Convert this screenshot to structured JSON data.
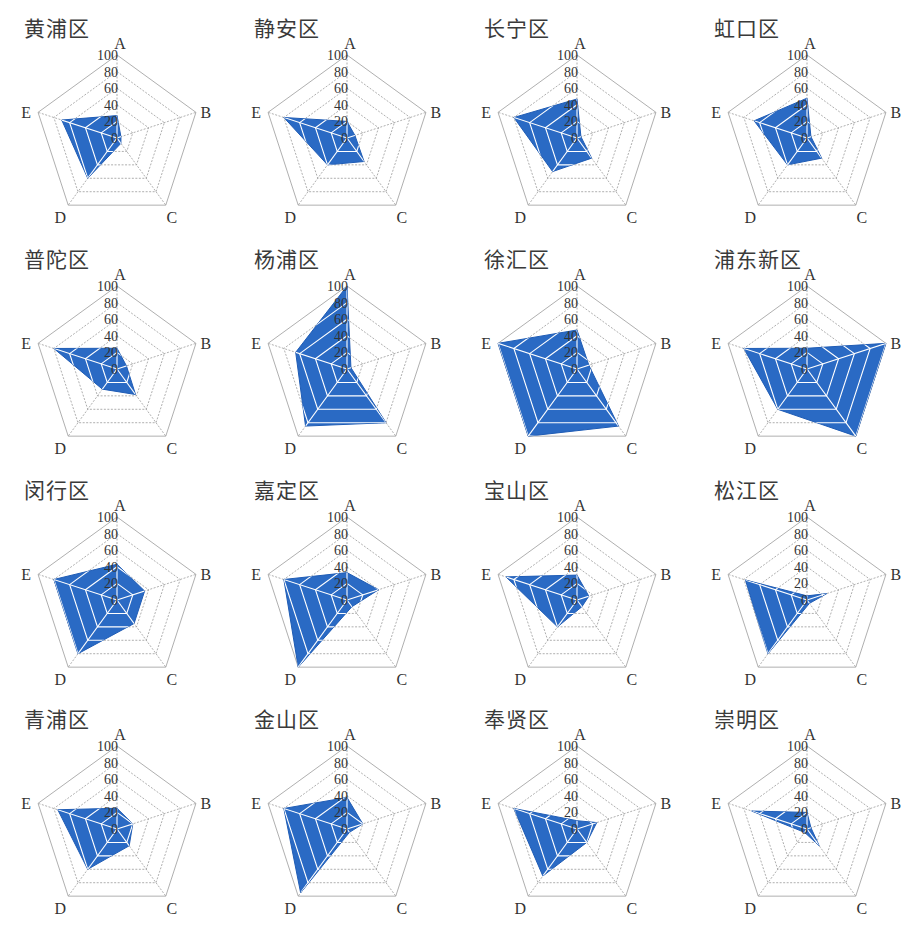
{
  "chart_data": [
    {
      "type": "radar",
      "title": "黄浦区",
      "axes": [
        "A",
        "B",
        "C",
        "D",
        "E"
      ],
      "values": [
        27,
        5,
        8,
        60,
        70
      ],
      "ticks": [
        0,
        20,
        40,
        60,
        80,
        100
      ],
      "range": [
        0,
        100
      ]
    },
    {
      "type": "radar",
      "title": "静安区",
      "axes": [
        "A",
        "B",
        "C",
        "D",
        "E"
      ],
      "values": [
        20,
        10,
        35,
        40,
        80
      ],
      "ticks": [
        0,
        20,
        40,
        60,
        80,
        100
      ],
      "range": [
        0,
        100
      ]
    },
    {
      "type": "radar",
      "title": "长宁区",
      "axes": [
        "A",
        "B",
        "C",
        "D",
        "E"
      ],
      "values": [
        47,
        5,
        30,
        50,
        80
      ],
      "ticks": [
        0,
        20,
        40,
        60,
        80,
        100
      ],
      "range": [
        0,
        100
      ]
    },
    {
      "type": "radar",
      "title": "虹口区",
      "axes": [
        "A",
        "B",
        "C",
        "D",
        "E"
      ],
      "values": [
        48,
        5,
        30,
        40,
        67
      ],
      "ticks": [
        0,
        20,
        40,
        60,
        80,
        100
      ],
      "range": [
        0,
        100
      ]
    },
    {
      "type": "radar",
      "title": "普陀区",
      "axes": [
        "A",
        "B",
        "C",
        "D",
        "E"
      ],
      "values": [
        25,
        12,
        38,
        30,
        80
      ],
      "ticks": [
        0,
        20,
        40,
        60,
        80,
        100
      ],
      "range": [
        0,
        100
      ]
    },
    {
      "type": "radar",
      "title": "杨浦区",
      "axes": [
        "A",
        "B",
        "C",
        "D",
        "E"
      ],
      "values": [
        100,
        5,
        80,
        85,
        65
      ],
      "ticks": [
        0,
        20,
        40,
        60,
        80,
        100
      ],
      "range": [
        0,
        100
      ]
    },
    {
      "type": "radar",
      "title": "徐汇区",
      "axes": [
        "A",
        "B",
        "C",
        "D",
        "E"
      ],
      "values": [
        47,
        15,
        85,
        100,
        100
      ],
      "ticks": [
        0,
        20,
        40,
        60,
        80,
        100
      ],
      "range": [
        0,
        100
      ]
    },
    {
      "type": "radar",
      "title": "浦东新区",
      "axes": [
        "A",
        "B",
        "C",
        "D",
        "E"
      ],
      "values": [
        25,
        100,
        100,
        60,
        80
      ],
      "ticks": [
        0,
        20,
        40,
        60,
        80,
        100
      ],
      "range": [
        0,
        100
      ]
    },
    {
      "type": "radar",
      "title": "闵行区",
      "axes": [
        "A",
        "B",
        "C",
        "D",
        "E"
      ],
      "values": [
        43,
        35,
        35,
        80,
        80
      ],
      "ticks": [
        0,
        20,
        40,
        60,
        80,
        100
      ],
      "range": [
        0,
        100
      ]
    },
    {
      "type": "radar",
      "title": "嘉定区",
      "axes": [
        "A",
        "B",
        "C",
        "D",
        "E"
      ],
      "values": [
        33,
        40,
        10,
        100,
        80
      ],
      "ticks": [
        0,
        20,
        40,
        60,
        80,
        100
      ],
      "range": [
        0,
        100
      ]
    },
    {
      "type": "radar",
      "title": "宝山区",
      "axes": [
        "A",
        "B",
        "C",
        "D",
        "E"
      ],
      "values": [
        30,
        15,
        10,
        40,
        90
      ],
      "ticks": [
        0,
        20,
        40,
        60,
        80,
        100
      ],
      "range": [
        0,
        100
      ]
    },
    {
      "type": "radar",
      "title": "松江区",
      "axes": [
        "A",
        "B",
        "C",
        "D",
        "E"
      ],
      "values": [
        5,
        25,
        5,
        80,
        78
      ],
      "ticks": [
        0,
        20,
        40,
        60,
        80,
        100
      ],
      "range": [
        0,
        100
      ]
    },
    {
      "type": "radar",
      "title": "青浦区",
      "axes": [
        "A",
        "B",
        "C",
        "D",
        "E"
      ],
      "values": [
        25,
        20,
        25,
        60,
        75
      ],
      "ticks": [
        0,
        20,
        40,
        60,
        80,
        100
      ],
      "range": [
        0,
        100
      ]
    },
    {
      "type": "radar",
      "title": "金山区",
      "axes": [
        "A",
        "B",
        "C",
        "D",
        "E"
      ],
      "values": [
        38,
        20,
        5,
        95,
        80
      ],
      "ticks": [
        0,
        20,
        40,
        60,
        80,
        100
      ],
      "range": [
        0,
        100
      ]
    },
    {
      "type": "radar",
      "title": "奉贤区",
      "axes": [
        "A",
        "B",
        "C",
        "D",
        "E"
      ],
      "values": [
        10,
        25,
        20,
        70,
        80
      ],
      "ticks": [
        0,
        20,
        40,
        60,
        80,
        100
      ],
      "range": [
        0,
        100
      ]
    },
    {
      "type": "radar",
      "title": "崇明区",
      "axes": [
        "A",
        "B",
        "C",
        "D",
        "E"
      ],
      "values": [
        20,
        5,
        25,
        5,
        70
      ],
      "ticks": [
        0,
        20,
        40,
        60,
        80,
        100
      ],
      "range": [
        0,
        100
      ]
    }
  ],
  "style": {
    "fill_color": "#2a6ac4",
    "fill_edge_color": "#1f5cb5",
    "grid_color": "#9a9a9a",
    "grid_on_fill_color": "#ffffff"
  }
}
